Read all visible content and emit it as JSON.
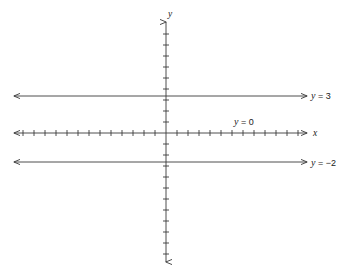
{
  "figure": {
    "title": "",
    "background_color": "#ffffff",
    "stroke_color": "#3a3a3a",
    "text_color": "#1a1a1a",
    "width": 356,
    "height": 276
  },
  "axes": {
    "x_axis_label": "x",
    "y_axis_label": "y",
    "origin_px": {
      "x": 166,
      "y": 133
    },
    "x_axis_px": {
      "x1": 14,
      "x2": 307,
      "y": 133
    },
    "y_axis_px": {
      "y1": 22,
      "y2": 262,
      "x": 166
    },
    "tick_spacing_px": 11,
    "x_ticks_left_count": 13,
    "x_ticks_right_count": 13,
    "y_ticks_up_count": 9,
    "y_ticks_down_count": 11,
    "tick_half_length_px": 3,
    "arrow_style": "both-ends-open-arrow"
  },
  "chart_data": {
    "type": "line",
    "title": "",
    "xlabel": "x",
    "ylabel": "y",
    "grid": false,
    "legend": "inline-right-labels",
    "xlim": [
      -13.8,
      12.8
    ],
    "ylim": [
      -11.7,
      10.1
    ],
    "series": [
      {
        "name": "y = 3",
        "label": "y = 3",
        "label_var": "y",
        "label_rel": "=",
        "label_value": "3",
        "equation_type": "horizontal",
        "y_value": 3,
        "color": "#3a3a3a",
        "label_position": "right",
        "label_px": {
          "x": 311,
          "y": 99
        },
        "line_px": {
          "x1": 14,
          "x2": 307,
          "y": 96
        }
      },
      {
        "name": "y = 0",
        "label": "y = 0",
        "label_var": "y",
        "label_rel": "=",
        "label_value": "0",
        "equation_type": "horizontal",
        "y_value": 0,
        "color": "#3a3a3a",
        "label_position": "above-right-of-origin",
        "label_px": {
          "x": 234,
          "y": 125
        },
        "line_px": {
          "x1": 14,
          "x2": 307,
          "y": 133
        }
      },
      {
        "name": "y = -2",
        "label": "y = −2",
        "label_var": "y",
        "label_rel": "=",
        "label_value": "−2",
        "equation_type": "horizontal",
        "y_value": -2,
        "color": "#3a3a3a",
        "label_position": "right",
        "label_px": {
          "x": 311,
          "y": 166
        },
        "line_px": {
          "x1": 14,
          "x2": 307,
          "y": 162
        }
      }
    ],
    "annotations": [
      {
        "text": "y",
        "role": "y-axis-name"
      },
      {
        "text": "x",
        "role": "x-axis-name"
      }
    ]
  }
}
